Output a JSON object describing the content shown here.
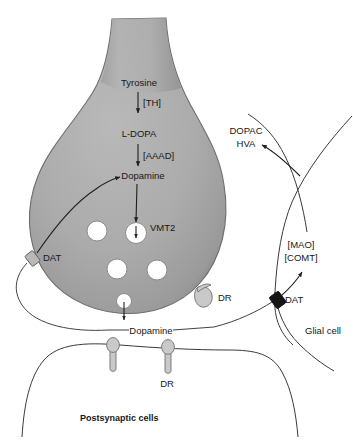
{
  "figure": {
    "background_color": "#ffffff",
    "ink_color": "#1f1f1f",
    "neuron_fill": "#a8a8a8",
    "vesicle_fill": "#ffffff",
    "receptor_fill": "#c9c9c9",
    "transporter_black": "#141414"
  },
  "presynaptic": {
    "synthesis_pathway": {
      "substrate_label": "Tyrosine",
      "enzyme_1_label": "[TH]",
      "intermediate_label": "L-DOPA",
      "enzyme_2_label": "[AAAD]",
      "product_label": "Dopamine"
    },
    "vesicle_transporter_label": "VMT2",
    "reuptake_transporter_label": "DAT",
    "autoreceptor_label": "DR"
  },
  "synapse": {
    "neurotransmitter_label": "Dopamine"
  },
  "glia": {
    "cell_label": "Glial cell",
    "transporter_label": "DAT",
    "enzyme_1_label": "[MAO]",
    "enzyme_2_label": "[COMT]",
    "metabolite_1_label": "DOPAC",
    "metabolite_2_label": "HVA"
  },
  "postsynaptic": {
    "receptor_label": "DR",
    "caption": "Postsynaptic cells"
  }
}
